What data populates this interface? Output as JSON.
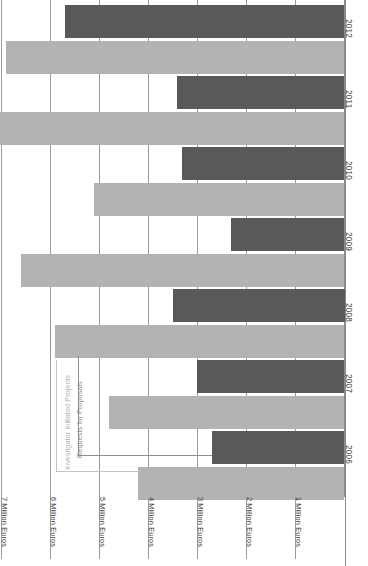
{
  "chart_data": {
    "type": "bar",
    "orientation": "horizontal",
    "title": "",
    "xlabel": "",
    "ylabel": "",
    "categories": [
      "2006",
      "2007",
      "2008",
      "2009",
      "2010",
      "2011",
      "2012"
    ],
    "series": [
      {
        "name": "Requests for Proposals",
        "color": "#595959",
        "values": [
          2.7,
          3.0,
          3.5,
          2.3,
          3.3,
          3.4,
          5.7
        ]
      },
      {
        "name": "Investigator Initiated Projects",
        "color": "#b3b3b3",
        "values": [
          4.2,
          4.8,
          5.9,
          6.6,
          5.1,
          7.1,
          6.9
        ]
      }
    ],
    "tick_labels": [
      "7 Million Euros",
      "6 Million Euros",
      "5 Million Euros",
      "4 Million Euros",
      "3 Million Euros",
      "2 Million Euros",
      "1 Million Euros"
    ],
    "tick_values": [
      7,
      6,
      5,
      4,
      3,
      2,
      1
    ],
    "xlim": [
      0,
      7
    ],
    "grid": true,
    "legend_position": "inside-lower-left",
    "units": "Million Euros"
  },
  "legend": {
    "entries": [
      {
        "label": "Investigator Initiated Projects",
        "color": "#b3b3b3"
      },
      {
        "label": "Requests for Proposals",
        "color": "#8f8f8f"
      }
    ]
  }
}
